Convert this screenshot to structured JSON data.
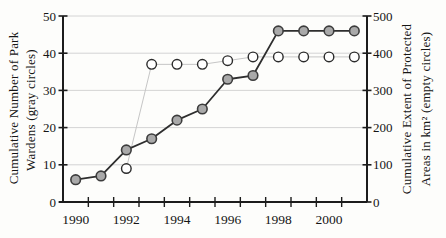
{
  "figure": {
    "background": "#fdfdfb"
  },
  "chart_data": {
    "type": "line",
    "title": "",
    "x_axis": {
      "tick_labels": [
        "1990",
        "1992",
        "1994",
        "1996",
        "1998",
        "2000"
      ],
      "label_years": [
        1990,
        1992,
        1994,
        1996,
        1998,
        2000
      ],
      "range": [
        1990,
        2001
      ],
      "ticks_every_year": true
    },
    "left_axis": {
      "label_line1": "Cumulative Number of Park",
      "label_line2": "Wardens (gray circles)",
      "ticks": [
        0,
        10,
        20,
        30,
        40,
        50
      ],
      "range": [
        0,
        50
      ]
    },
    "right_axis": {
      "label_line1": "Cumulative Extent of Protected",
      "label_line2": "Areas in km² (empty circles)",
      "ticks": [
        0,
        100,
        200,
        300,
        400,
        500
      ],
      "range": [
        0,
        500
      ]
    },
    "grid": true,
    "series": [
      {
        "name": "park-wardens",
        "legend": "gray circles",
        "axis": "left",
        "marker": "filled-gray-circle",
        "x": [
          1990,
          1991,
          1992,
          1993,
          1994,
          1995,
          1996,
          1997,
          1998,
          1999,
          2000,
          2001
        ],
        "values": [
          6,
          7,
          14,
          17,
          22,
          25,
          33,
          34,
          46,
          46,
          46,
          46
        ],
        "line_color": "#2e2e2e",
        "marker_fill": "#a9a9a9",
        "marker_stroke": "#3c3c3c"
      },
      {
        "name": "protected-areas",
        "legend": "empty circles",
        "axis": "right",
        "marker": "empty-circle",
        "x": [
          1992,
          1993,
          1994,
          1995,
          1996,
          1997,
          1998,
          1999,
          2000,
          2001
        ],
        "values": [
          90,
          370,
          370,
          370,
          380,
          390,
          390,
          390,
          390,
          390
        ],
        "line_color": "#c6c6c6",
        "marker_fill": "#ffffff",
        "marker_stroke": "#2b2b2b"
      }
    ],
    "colors": {
      "axis": "#1c1c1c",
      "grid": "#cfcfcf",
      "text": "#151515"
    }
  }
}
